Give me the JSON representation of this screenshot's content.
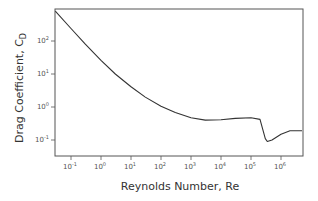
{
  "chart_data": {
    "type": "line",
    "title": "",
    "xlabel": "Reynolds Number, Re",
    "ylabel": "Drag Coefficient, C_D",
    "ylabel_main": "Drag Coefficient, C",
    "ylabel_sub": "D",
    "xscale": "log",
    "yscale": "log",
    "xlim": [
      0.03,
      5000000
    ],
    "ylim": [
      0.04,
      900
    ],
    "grid": false,
    "legend": null,
    "x_ticks": [
      {
        "base": "10",
        "exp": "-1",
        "value": 0.1
      },
      {
        "base": "10",
        "exp": "0",
        "value": 1
      },
      {
        "base": "10",
        "exp": "1",
        "value": 10
      },
      {
        "base": "10",
        "exp": "2",
        "value": 100
      },
      {
        "base": "10",
        "exp": "3",
        "value": 1000
      },
      {
        "base": "10",
        "exp": "4",
        "value": 10000
      },
      {
        "base": "10",
        "exp": "5",
        "value": 100000
      },
      {
        "base": "10",
        "exp": "6",
        "value": 1000000
      }
    ],
    "y_ticks": [
      {
        "base": "10",
        "exp": "-1",
        "value": 0.1
      },
      {
        "base": "10",
        "exp": "0",
        "value": 1
      },
      {
        "base": "10",
        "exp": "1",
        "value": 10
      },
      {
        "base": "10",
        "exp": "2",
        "value": 100
      }
    ],
    "series": [
      {
        "name": "Sphere drag curve",
        "color": "#333333",
        "x": [
          0.03,
          0.1,
          0.3,
          1,
          3,
          10,
          30,
          100,
          300,
          1000,
          3000,
          10000,
          30000,
          100000,
          200000,
          300000,
          350000,
          500000,
          1000000,
          2000000,
          5000000
        ],
        "y": [
          800,
          240,
          80,
          26,
          10,
          4.1,
          2.0,
          1.05,
          0.68,
          0.47,
          0.4,
          0.41,
          0.45,
          0.47,
          0.42,
          0.11,
          0.09,
          0.1,
          0.15,
          0.19,
          0.19
        ]
      }
    ]
  }
}
